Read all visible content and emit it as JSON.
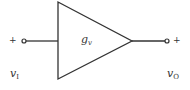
{
  "diagram": {
    "type": "amplifier-block",
    "gain_label": {
      "main": "g",
      "sub": "v"
    },
    "input": {
      "polarity": "+",
      "label": {
        "main": "v",
        "sub": "I"
      }
    },
    "output": {
      "polarity": "+",
      "label": {
        "main": "v",
        "sub": "O"
      }
    },
    "colors": {
      "stroke": "#333333",
      "background": "#ffffff"
    }
  }
}
